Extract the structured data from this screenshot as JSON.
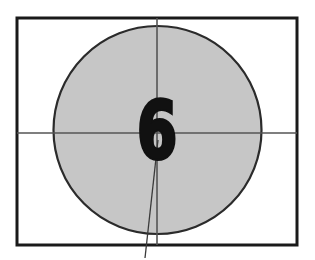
{
  "frame": {
    "type": "film-countdown-leader",
    "width": 315,
    "height": 260,
    "background_color": "#ffffff",
    "title": "Academy Countdown Leader Frame"
  },
  "border": {
    "label": "frame-border",
    "x": 17,
    "y": 18,
    "width": 280,
    "height": 227,
    "stroke_color": "#1a1a1a",
    "stroke_width": 3,
    "fill": "none"
  },
  "circle": {
    "label": "countdown-circle",
    "center_x": 157.5,
    "center_y": 130,
    "radius": 104,
    "fill_color": "#c6c6c6",
    "stroke_color": "#2b2b2b",
    "stroke_width": 2.2
  },
  "crosshair": {
    "label": "registration-crosshair",
    "stroke_color": "#555555",
    "stroke_width": 1.6,
    "vertical": {
      "x": 157,
      "y1": 18,
      "y2": 245
    },
    "horizontal": {
      "y": 133,
      "x1": 17,
      "x2": 297
    }
  },
  "sweep_line": {
    "label": "sweep-hand-line",
    "stroke_color": "#3a3a3a",
    "stroke_width": 1.3,
    "x1": 158,
    "y1": 140,
    "x2": 145,
    "y2": 258
  },
  "digit": {
    "label": "countdown-number",
    "value": "6",
    "center_x": 157,
    "baseline_y": 158,
    "font_size": 78,
    "color": "#111111",
    "stroke_color": "#111111",
    "stroke_width": 4,
    "scale_x": 0.74
  }
}
